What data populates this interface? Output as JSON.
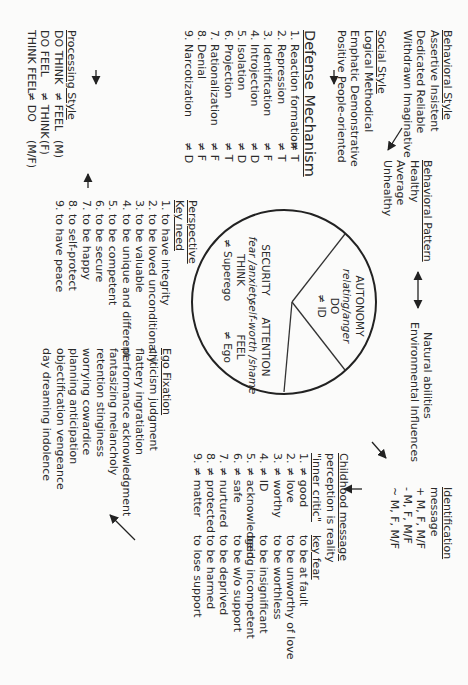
{
  "behavioral_style": {
    "heading": "Behavioral Style",
    "items": [
      "Assertive Insistent",
      "Dedicated Reliable",
      "Withdrawn Imaginative"
    ]
  },
  "social_style": {
    "heading": "Social Style",
    "items": [
      "Logical Methodical",
      "Emphatic Demonstrative",
      "Positive People-oriented"
    ]
  },
  "behavioral_pattern": {
    "heading": "Behavioral Pattern",
    "items": [
      "Healthy",
      "Average",
      "Unhealthy"
    ]
  },
  "natural_environmental": {
    "items": [
      "Natural abilities",
      "Environmental Influences"
    ]
  },
  "identification": {
    "heading": "Identification",
    "items": [
      "message",
      "+ M, F, M/F",
      "- M, F, M/F",
      "~ M, F, M/F"
    ]
  },
  "defense_mechanism": {
    "heading": "Defense Mechanism",
    "items": [
      {
        "name": "1. Reaction formation",
        "code": "≠ T"
      },
      {
        "name": "2. Repression",
        "code": "≠ T"
      },
      {
        "name": "3. Identification",
        "code": "≠ F"
      },
      {
        "name": "4. Introjection",
        "code": "≠ D"
      },
      {
        "name": "5. Isolation",
        "code": "≠ D"
      },
      {
        "name": "6. Projection",
        "code": "≠ T"
      },
      {
        "name": "7. Rationalization",
        "code": "≠ F"
      },
      {
        "name": "8. Denial",
        "code": "≠ F"
      },
      {
        "name": "9. Narcotization",
        "code": "≠ D"
      }
    ]
  },
  "processing_style": {
    "heading": "Processing Style",
    "items": [
      {
        "a": "DO THINK",
        "b": "≠ FEEL",
        "c": "(M)"
      },
      {
        "a": "DO FEEL",
        "b": "≠ THINK",
        "c": "(F)"
      },
      {
        "a": "THINK FEEL",
        "b": "≠ DO",
        "c": "(M/F)"
      }
    ]
  },
  "circle": {
    "autonomy": {
      "title": "AUTONOMY",
      "emotion": "relating/anger",
      "mode": "DO",
      "neg": "≠ ID"
    },
    "security": {
      "title": "SECURITY",
      "emotion": "fear /anxiety",
      "mode": "THINK",
      "neg": "≠ Superego"
    },
    "attention": {
      "title": "ATTENTION",
      "emotion": "self-worth /shame",
      "mode": "FEEL",
      "neg": "≠ Ego"
    }
  },
  "perspective": {
    "heading": "Perspective",
    "key_need_heading": "Key need",
    "key_needs": [
      "1. to have integrity",
      "2. to be loved unconditionally",
      "3. to be valuable",
      "4. to be unique and different",
      "5. to be competent",
      "6. to be secure",
      "7. to be happy",
      "8. to self-protect",
      "9. to have peace"
    ]
  },
  "ego_fixation": {
    "heading": "Ego Fixation",
    "items": [
      "criticism judgment",
      "flattery ingratiation",
      "performance acknowledgment",
      "fantasizing melancholy",
      "retention stinginess",
      "worrying cowardice",
      "planning anticipation",
      "objectification vengeance",
      "day dreaming indolence"
    ]
  },
  "childhood_message": {
    "heading": "Childhood message",
    "subtitle": "perception is reality",
    "inner_critic_heading": "\"inner critic\"",
    "key_fear_heading": "key fear",
    "rows": [
      {
        "critic": "1. ≠ good",
        "fear": "to be at fault"
      },
      {
        "critic": "2. ≠ love",
        "fear": "to be unworthy of love"
      },
      {
        "critic": "3. ≠ worthy",
        "fear": "to be worthless"
      },
      {
        "critic": "4. ≠ ID",
        "fear": "to be insignificant"
      },
      {
        "critic": "5. ≠ acknowledged",
        "fear": "being incompetent"
      },
      {
        "critic": "6. ≠ safe",
        "fear": "to be w/o support"
      },
      {
        "critic": "7. ≠ nurtured",
        "fear": "to be deprived"
      },
      {
        "critic": "8. ≠ protected",
        "fear": "to be harmed"
      },
      {
        "critic": "9. ≠ matter",
        "fear": "to lose support"
      }
    ]
  },
  "colors": {
    "ink": "#2a2a2a",
    "paper": "#fbfbfa"
  }
}
